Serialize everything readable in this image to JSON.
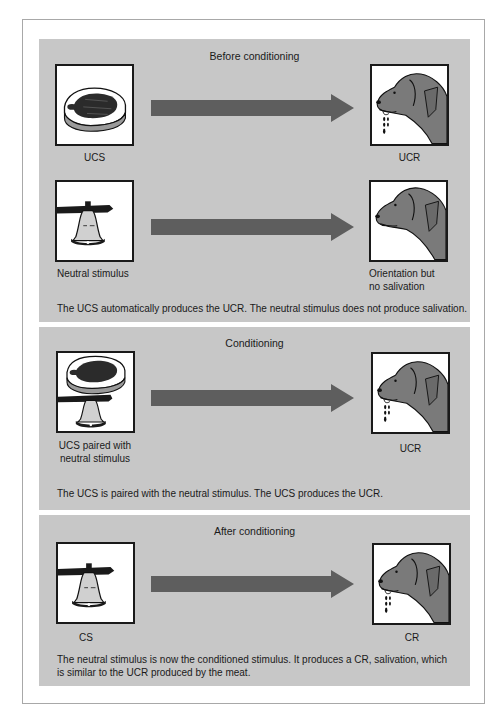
{
  "figure": {
    "panels": [
      {
        "title": "Before conditioning",
        "rows": [
          {
            "stimulus_label": "UCS",
            "stimulus_icon": "meat-icon",
            "response_label": "UCR",
            "response_icon": "salivating-dog-icon"
          },
          {
            "stimulus_label": "Neutral stimulus",
            "stimulus_icon": "bell-icon",
            "response_label_line1": "Orientation but",
            "response_label_line2": "no salivation",
            "response_icon": "dog-icon"
          }
        ],
        "caption": "The UCS automatically produces the UCR. The neutral stimulus does not produce salivation."
      },
      {
        "title": "Conditioning",
        "rows": [
          {
            "stimulus_label_line1": "UCS paired with",
            "stimulus_label_line2": "neutral stimulus",
            "stimulus_icon": "meat-and-bell-icon",
            "response_label": "UCR",
            "response_icon": "salivating-dog-icon"
          }
        ],
        "caption": "The UCS is paired with the neutral stimulus.  The UCS produces the UCR."
      },
      {
        "title": "After conditioning",
        "rows": [
          {
            "stimulus_label": "CS",
            "stimulus_icon": "bell-icon",
            "response_label": "CR",
            "response_icon": "salivating-dog-icon"
          }
        ],
        "caption_line1": "The neutral stimulus is now the conditioned stimulus.  It produces a CR, salivation, which",
        "caption_line2": "is similar to the UCR produced by the meat."
      }
    ],
    "colors": {
      "panel_bg": "#c7c7c7",
      "arrow": "#5e5e5e",
      "dog_fill": "#7a7a7a",
      "frame_border": "#a8a8a8"
    }
  }
}
